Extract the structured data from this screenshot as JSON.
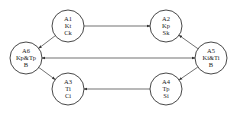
{
  "diagram": {
    "nodes": [
      {
        "id": "A1",
        "lines": [
          "A1",
          "Kt",
          "Ck"
        ],
        "cx": 68,
        "cy": 26,
        "r": 16
      },
      {
        "id": "A2",
        "lines": [
          "A2",
          "Kp",
          "Sk"
        ],
        "cx": 166,
        "cy": 26,
        "r": 16
      },
      {
        "id": "A3",
        "lines": [
          "A3",
          "Ti",
          "Ci"
        ],
        "cx": 68,
        "cy": 89,
        "r": 16
      },
      {
        "id": "A4",
        "lines": [
          "A4",
          "Tp",
          "Si"
        ],
        "cx": 166,
        "cy": 89,
        "r": 16
      },
      {
        "id": "A5",
        "lines": [
          "A5",
          "Ki&Ti",
          "B"
        ],
        "cx": 211,
        "cy": 58,
        "r": 16
      },
      {
        "id": "A6",
        "lines": [
          "A6",
          "Kp&Tp",
          "B"
        ],
        "cx": 26,
        "cy": 58,
        "r": 16
      }
    ],
    "edges": [
      {
        "from": "A1",
        "to": "A2",
        "direction": "forward"
      },
      {
        "from": "A1",
        "to": "A6",
        "direction": "forward"
      },
      {
        "from": "A6",
        "to": "A3",
        "direction": "forward"
      },
      {
        "from": "A4",
        "to": "A3",
        "direction": "forward"
      },
      {
        "from": "A5",
        "to": "A2",
        "direction": "forward"
      },
      {
        "from": "A5",
        "to": "A4",
        "direction": "forward"
      },
      {
        "from": "A6",
        "to": "A5",
        "direction": "both"
      }
    ],
    "colors": {
      "stroke": "#333333",
      "text": "#222222",
      "background": "#ffffff"
    }
  }
}
